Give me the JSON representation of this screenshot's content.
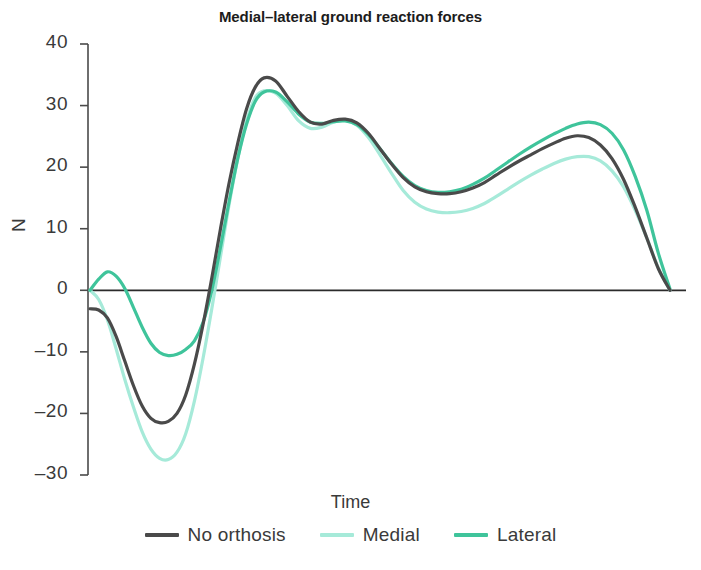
{
  "chart_data": {
    "type": "line",
    "title": "Medial–lateral ground reaction forces",
    "xlabel": "Time",
    "ylabel": "N",
    "grid": false,
    "legend_position": "bottom",
    "xlim": [
      0,
      100
    ],
    "ylim": [
      -30,
      40
    ],
    "yticks": [
      40,
      30,
      20,
      10,
      0,
      -10,
      -20,
      -30
    ],
    "ytick_labels": [
      "40",
      "30",
      "20",
      "10",
      "0",
      "–10",
      "–20",
      "–30"
    ],
    "xticks": [],
    "xtick_labels": [],
    "zero_line": 0,
    "x": [
      0,
      1.5,
      3,
      4.5,
      6,
      7.5,
      9,
      10.5,
      12,
      13.5,
      15,
      16.5,
      18,
      19.5,
      21,
      22.5,
      24,
      25.5,
      27,
      28.5,
      30,
      32,
      34,
      36,
      38,
      40,
      42,
      44,
      46,
      48,
      50,
      52,
      54,
      56,
      58,
      60,
      62,
      64,
      66,
      68,
      70,
      72,
      74,
      76,
      78,
      80,
      82,
      84,
      86,
      88,
      90,
      92,
      94,
      96,
      98,
      100
    ],
    "series": [
      {
        "name": "No orthosis",
        "color": "#4a4a4a",
        "values": [
          -3.0,
          -3.2,
          -4.5,
          -7.5,
          -11.5,
          -15.5,
          -18.8,
          -20.8,
          -21.5,
          -21.3,
          -20.0,
          -17.0,
          -12.0,
          -5.5,
          2.0,
          10.0,
          17.5,
          24.0,
          29.5,
          33.0,
          34.5,
          34.0,
          31.5,
          29.0,
          27.3,
          27.0,
          27.6,
          27.8,
          27.2,
          25.5,
          23.0,
          20.5,
          18.3,
          16.8,
          16.0,
          15.7,
          15.7,
          16.0,
          16.6,
          17.5,
          18.7,
          19.9,
          21.0,
          22.0,
          23.0,
          23.9,
          24.7,
          25.1,
          24.8,
          23.6,
          21.4,
          18.0,
          13.5,
          8.5,
          3.5,
          0.0
        ]
      },
      {
        "name": "Medial",
        "color": "#a6ead9",
        "values": [
          0.0,
          -1.5,
          -4.8,
          -9.5,
          -14.5,
          -19.0,
          -23.0,
          -25.8,
          -27.3,
          -27.5,
          -26.3,
          -23.3,
          -18.0,
          -11.0,
          -3.0,
          5.5,
          14.0,
          21.5,
          27.5,
          31.3,
          32.4,
          32.0,
          30.0,
          27.5,
          26.3,
          26.5,
          27.3,
          27.6,
          26.8,
          24.8,
          22.0,
          19.0,
          16.2,
          14.3,
          13.2,
          12.7,
          12.6,
          12.8,
          13.3,
          14.1,
          15.2,
          16.4,
          17.6,
          18.7,
          19.7,
          20.6,
          21.3,
          21.7,
          21.7,
          21.0,
          19.4,
          16.8,
          13.0,
          8.5,
          3.6,
          0.0
        ]
      },
      {
        "name": "Lateral",
        "color": "#3fc49b",
        "values": [
          0.0,
          1.8,
          3.0,
          2.3,
          0.3,
          -2.8,
          -6.0,
          -8.6,
          -10.1,
          -10.6,
          -10.4,
          -9.6,
          -8.2,
          -5.2,
          0.0,
          7.0,
          14.5,
          21.5,
          27.0,
          30.7,
          32.2,
          32.2,
          30.6,
          28.6,
          27.3,
          27.1,
          27.4,
          27.5,
          26.9,
          25.3,
          23.0,
          20.6,
          18.5,
          17.0,
          16.2,
          15.9,
          16.0,
          16.4,
          17.2,
          18.2,
          19.5,
          20.8,
          22.1,
          23.3,
          24.4,
          25.4,
          26.3,
          27.0,
          27.3,
          26.9,
          25.5,
          22.8,
          18.5,
          13.0,
          6.0,
          0.2
        ]
      }
    ]
  },
  "legend": {
    "items": [
      {
        "label": "No orthosis",
        "color": "#4a4a4a"
      },
      {
        "label": "Medial",
        "color": "#a6ead9"
      },
      {
        "label": "Lateral",
        "color": "#3fc49b"
      }
    ]
  },
  "axis": {
    "y_title": "N",
    "x_title": "Time"
  },
  "title": "Medial–lateral ground reaction forces"
}
